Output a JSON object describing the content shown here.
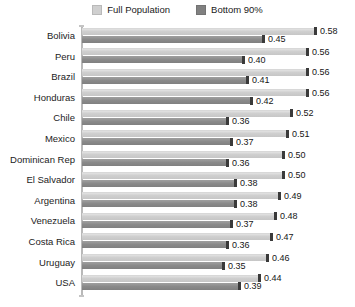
{
  "legend": {
    "position": "top-center",
    "entries": [
      {
        "label": "Full Population",
        "color": "#cfcfcf",
        "icon": "legend-swatch-icon"
      },
      {
        "label": "Bottom 90%",
        "color": "#808080",
        "icon": "legend-swatch-icon"
      }
    ]
  },
  "chart_data": {
    "type": "bar",
    "orientation": "horizontal",
    "title": "",
    "subtitle": "",
    "xlabel": "",
    "ylabel": "",
    "xlim": [
      0,
      0.6
    ],
    "grid": false,
    "legend_position": "top-center",
    "categories": [
      "Bolivia",
      "Peru",
      "Brazil",
      "Honduras",
      "Chile",
      "Mexico",
      "Dominican Rep",
      "El Salvador",
      "Argentina",
      "Venezuela",
      "Costa Rica",
      "Uruguay",
      "USA"
    ],
    "series": [
      {
        "name": "Full Population",
        "color": "#cfcfcf",
        "values": [
          0.58,
          0.56,
          0.56,
          0.56,
          0.52,
          0.51,
          0.5,
          0.5,
          0.49,
          0.48,
          0.47,
          0.46,
          0.44
        ],
        "labels": [
          "0.58",
          "0.56",
          "0.56",
          "0.56",
          "0.52",
          "0.51",
          "0.50",
          "0.50",
          "0.49",
          "0.48",
          "0.47",
          "0.46",
          "0.44"
        ]
      },
      {
        "name": "Bottom 90%",
        "color": "#808080",
        "values": [
          0.45,
          0.4,
          0.41,
          0.42,
          0.36,
          0.37,
          0.36,
          0.38,
          0.38,
          0.37,
          0.36,
          0.35,
          0.39
        ],
        "labels": [
          "0.45",
          "0.40",
          "0.41",
          "0.42",
          "0.36",
          "0.37",
          "0.36",
          "0.38",
          "0.38",
          "0.37",
          "0.36",
          "0.35",
          "0.39"
        ]
      }
    ]
  }
}
